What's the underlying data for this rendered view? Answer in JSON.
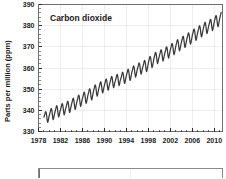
{
  "chart_data": {
    "type": "line",
    "title": "Carbon dioxide",
    "xlabel": "",
    "ylabel": "Parts per million (ppm)",
    "xlim": [
      1978,
      2011.5
    ],
    "ylim": [
      330,
      390
    ],
    "grid": true,
    "legend": null,
    "line_color": "#3a3a3a",
    "xticks": [
      1978,
      1982,
      1986,
      1990,
      1994,
      1998,
      2002,
      2006,
      2010
    ],
    "xtick_labels": [
      "1978",
      "1982",
      "1986",
      "1990",
      "1994",
      "1998",
      "2002",
      "2006",
      "2010"
    ],
    "xminor_tick_interval": 1,
    "yticks": [
      330,
      340,
      350,
      360,
      370,
      380,
      390
    ],
    "ytick_labels": [
      "330",
      "340",
      "350",
      "360",
      "370",
      "380",
      "390"
    ],
    "series": [
      {
        "name": "Atmospheric CO2 concentration",
        "description": "Monthly mean CO2 with seasonal sawtooth on rising trend",
        "x": [
          1979.0,
          1979.08,
          1979.17,
          1979.25,
          1979.33,
          1979.42,
          1979.5,
          1979.58,
          1979.67,
          1979.75,
          1979.83,
          1979.92,
          1980.0,
          1980.08,
          1980.17,
          1980.25,
          1980.33,
          1980.42,
          1980.5,
          1980.58,
          1980.67,
          1980.75,
          1980.83,
          1980.92,
          1981.0,
          1981.08,
          1981.17,
          1981.25,
          1981.33,
          1981.42,
          1981.5,
          1981.58,
          1981.67,
          1981.75,
          1981.83,
          1981.92,
          1982.0,
          1982.08,
          1982.17,
          1982.25,
          1982.33,
          1982.42,
          1982.5,
          1982.58,
          1982.67,
          1982.75,
          1982.83,
          1982.92,
          1983.0,
          1983.08,
          1983.17,
          1983.25,
          1983.33,
          1983.42,
          1983.5,
          1983.58,
          1983.67,
          1983.75,
          1983.83,
          1983.92,
          1984.0,
          1984.08,
          1984.17,
          1984.25,
          1984.33,
          1984.42,
          1984.5,
          1984.58,
          1984.67,
          1984.75,
          1984.83,
          1984.92,
          1985.0,
          1985.08,
          1985.17,
          1985.25,
          1985.33,
          1985.42,
          1985.5,
          1985.58,
          1985.67,
          1985.75,
          1985.83,
          1985.92,
          1986.0,
          1986.08,
          1986.17,
          1986.25,
          1986.33,
          1986.42,
          1986.5,
          1986.58,
          1986.67,
          1986.75,
          1986.83,
          1986.92,
          1987.0,
          1987.08,
          1987.17,
          1987.25,
          1987.33,
          1987.42,
          1987.5,
          1987.58,
          1987.67,
          1987.75,
          1987.83,
          1987.92,
          1988.0,
          1988.08,
          1988.17,
          1988.25,
          1988.33,
          1988.42,
          1988.5,
          1988.58,
          1988.67,
          1988.75,
          1988.83,
          1988.92,
          1989.0,
          1989.08,
          1989.17,
          1989.25,
          1989.33,
          1989.42,
          1989.5,
          1989.58,
          1989.67,
          1989.75,
          1989.83,
          1989.92,
          1990.0,
          1990.08,
          1990.17,
          1990.25,
          1990.33,
          1990.42,
          1990.5,
          1990.58,
          1990.67,
          1990.75,
          1990.83,
          1990.92,
          1991.0,
          1991.08,
          1991.17,
          1991.25,
          1991.33,
          1991.42,
          1991.5,
          1991.58,
          1991.67,
          1991.75,
          1991.83,
          1991.92,
          1992.0,
          1992.08,
          1992.17,
          1992.25,
          1992.33,
          1992.42,
          1992.5,
          1992.58,
          1992.67,
          1992.75,
          1992.83,
          1992.92,
          1993.0,
          1993.08,
          1993.17,
          1993.25,
          1993.33,
          1993.42,
          1993.5,
          1993.58,
          1993.67,
          1993.75,
          1993.83,
          1993.92,
          1994.0,
          1994.08,
          1994.17,
          1994.25,
          1994.33,
          1994.42,
          1994.5,
          1994.58,
          1994.67,
          1994.75,
          1994.83,
          1994.92,
          1995.0,
          1995.08,
          1995.17,
          1995.25,
          1995.33,
          1995.42,
          1995.5,
          1995.58,
          1995.67,
          1995.75,
          1995.83,
          1995.92,
          1996.0,
          1996.08,
          1996.17,
          1996.25,
          1996.33,
          1996.42,
          1996.5,
          1996.58,
          1996.67,
          1996.75,
          1996.83,
          1996.92,
          1997.0,
          1997.08,
          1997.17,
          1997.25,
          1997.33,
          1997.42,
          1997.5,
          1997.58,
          1997.67,
          1997.75,
          1997.83,
          1997.92,
          1998.0,
          1998.08,
          1998.17,
          1998.25,
          1998.33,
          1998.42,
          1998.5,
          1998.58,
          1998.67,
          1998.75,
          1998.83,
          1998.92,
          1999.0,
          1999.08,
          1999.17,
          1999.25,
          1999.33,
          1999.42,
          1999.5,
          1999.58,
          1999.67,
          1999.75,
          1999.83,
          1999.92,
          2000.0,
          2000.08,
          2000.17,
          2000.25,
          2000.33,
          2000.42,
          2000.5,
          2000.58,
          2000.67,
          2000.75,
          2000.83,
          2000.92,
          2001.0,
          2001.08,
          2001.17,
          2001.25,
          2001.33,
          2001.42,
          2001.5,
          2001.58,
          2001.67,
          2001.75,
          2001.83,
          2001.92,
          2002.0,
          2002.08,
          2002.17,
          2002.25,
          2002.33,
          2002.42,
          2002.5,
          2002.58,
          2002.67,
          2002.75,
          2002.83,
          2002.92,
          2003.0,
          2003.08,
          2003.17,
          2003.25,
          2003.33,
          2003.42,
          2003.5,
          2003.58,
          2003.67,
          2003.75,
          2003.83,
          2003.92,
          2004.0,
          2004.08,
          2004.17,
          2004.25,
          2004.33,
          2004.42,
          2004.5,
          2004.58,
          2004.67,
          2004.75,
          2004.83,
          2004.92,
          2005.0,
          2005.08,
          2005.17,
          2005.25,
          2005.33,
          2005.42,
          2005.5,
          2005.58,
          2005.67,
          2005.75,
          2005.83,
          2005.92,
          2006.0,
          2006.08,
          2006.17,
          2006.25,
          2006.33,
          2006.42,
          2006.5,
          2006.58,
          2006.67,
          2006.75,
          2006.83,
          2006.92,
          2007.0,
          2007.08,
          2007.17,
          2007.25,
          2007.33,
          2007.42,
          2007.5,
          2007.58,
          2007.67,
          2007.75,
          2007.83,
          2007.92,
          2008.0,
          2008.08,
          2008.17,
          2008.25,
          2008.33,
          2008.42,
          2008.5,
          2008.58,
          2008.67,
          2008.75,
          2008.83,
          2008.92,
          2009.0,
          2009.08,
          2009.17,
          2009.25,
          2009.33,
          2009.42,
          2009.5,
          2009.58,
          2009.67,
          2009.75,
          2009.83,
          2009.92,
          2010.0,
          2010.08,
          2010.17,
          2010.25,
          2010.33,
          2010.42,
          2010.5,
          2010.58,
          2010.67,
          2010.75,
          2010.83,
          2010.92,
          2011.0,
          2011.08,
          2011.17,
          2011.25
        ],
        "y": [
          336.8,
          337.6,
          338.3,
          339.2,
          339.4,
          338.7,
          337.2,
          335.3,
          334.3,
          334.8,
          336.0,
          337.2,
          338.0,
          338.7,
          339.6,
          340.6,
          340.9,
          340.2,
          338.6,
          336.7,
          335.6,
          336.1,
          337.3,
          338.4,
          339.2,
          340.0,
          340.9,
          341.9,
          342.2,
          341.5,
          339.9,
          338.0,
          336.9,
          337.4,
          338.6,
          339.7,
          340.2,
          341.0,
          341.9,
          342.9,
          343.2,
          342.5,
          340.9,
          339.0,
          337.9,
          338.4,
          339.6,
          340.7,
          341.3,
          342.1,
          343.0,
          344.0,
          344.3,
          343.6,
          342.0,
          340.1,
          339.0,
          339.5,
          340.7,
          341.8,
          342.7,
          343.5,
          344.4,
          345.4,
          345.7,
          345.0,
          343.4,
          341.5,
          340.4,
          340.9,
          342.1,
          343.2,
          344.2,
          345.0,
          345.9,
          346.9,
          347.2,
          346.5,
          344.9,
          343.0,
          341.9,
          342.4,
          343.6,
          344.7,
          345.6,
          346.4,
          347.3,
          348.3,
          348.6,
          347.9,
          346.3,
          344.4,
          343.3,
          343.8,
          345.0,
          346.1,
          347.2,
          348.0,
          348.9,
          349.9,
          350.2,
          349.5,
          347.9,
          346.0,
          344.9,
          345.4,
          346.6,
          347.7,
          349.0,
          349.8,
          350.7,
          351.7,
          352.0,
          351.3,
          349.7,
          347.8,
          346.7,
          347.2,
          348.4,
          349.5,
          350.5,
          351.3,
          352.2,
          353.2,
          353.5,
          352.8,
          351.2,
          349.3,
          348.2,
          348.7,
          349.9,
          351.0,
          351.8,
          352.6,
          353.5,
          354.5,
          354.8,
          354.1,
          352.5,
          350.6,
          349.5,
          350.0,
          351.2,
          352.3,
          353.0,
          353.8,
          354.7,
          355.7,
          356.0,
          355.3,
          353.7,
          351.8,
          350.7,
          351.2,
          352.4,
          353.5,
          354.0,
          354.8,
          355.7,
          356.7,
          357.0,
          356.3,
          354.7,
          352.8,
          351.7,
          352.2,
          353.4,
          354.5,
          355.0,
          355.8,
          356.7,
          357.7,
          358.0,
          357.3,
          355.7,
          353.8,
          352.7,
          353.2,
          354.4,
          355.5,
          356.4,
          357.2,
          358.1,
          359.1,
          359.4,
          358.7,
          357.1,
          355.2,
          354.1,
          354.6,
          355.8,
          356.9,
          358.0,
          358.8,
          359.7,
          360.7,
          361.0,
          360.3,
          358.7,
          356.8,
          355.7,
          356.2,
          357.4,
          358.5,
          359.4,
          360.2,
          361.1,
          362.1,
          362.4,
          361.7,
          360.1,
          358.2,
          357.1,
          357.6,
          358.8,
          359.9,
          360.6,
          361.4,
          362.3,
          363.3,
          363.6,
          362.9,
          361.3,
          359.4,
          358.3,
          358.8,
          360.0,
          361.1,
          362.5,
          363.3,
          364.2,
          365.2,
          365.5,
          364.8,
          363.2,
          361.3,
          360.2,
          360.7,
          361.9,
          363.0,
          364.4,
          365.2,
          366.1,
          367.1,
          367.4,
          366.7,
          365.1,
          363.2,
          362.1,
          362.6,
          363.8,
          364.9,
          365.6,
          366.4,
          367.3,
          368.3,
          368.6,
          367.9,
          366.3,
          364.4,
          363.3,
          363.8,
          365.0,
          366.1,
          367.0,
          367.8,
          368.7,
          369.7,
          370.0,
          369.3,
          367.7,
          365.8,
          364.7,
          365.2,
          366.4,
          367.5,
          368.6,
          369.4,
          370.3,
          371.3,
          371.6,
          370.9,
          369.3,
          367.4,
          366.3,
          366.8,
          368.0,
          369.1,
          370.4,
          371.2,
          372.1,
          373.1,
          373.4,
          372.7,
          371.1,
          369.2,
          368.1,
          368.6,
          369.8,
          370.9,
          372.0,
          372.8,
          373.7,
          374.7,
          375.0,
          374.3,
          372.7,
          370.8,
          369.7,
          370.2,
          371.4,
          372.5,
          373.6,
          374.4,
          375.3,
          376.3,
          376.6,
          375.9,
          374.3,
          372.4,
          371.3,
          371.8,
          373.0,
          374.1,
          375.4,
          376.2,
          377.1,
          378.1,
          378.4,
          377.7,
          376.1,
          374.2,
          373.1,
          373.6,
          374.8,
          375.9,
          377.0,
          377.8,
          378.7,
          379.7,
          380.0,
          379.3,
          377.7,
          375.8,
          374.7,
          375.2,
          376.4,
          377.5,
          378.6,
          379.4,
          380.3,
          381.3,
          381.6,
          380.9,
          379.3,
          377.4,
          376.3,
          376.8,
          378.0,
          379.1,
          380.0,
          380.8,
          381.7,
          382.7,
          383.0,
          382.3,
          380.7,
          378.8,
          377.7,
          378.2,
          379.4,
          380.5,
          381.8,
          382.6,
          383.5,
          384.5,
          384.8,
          384.1,
          382.5,
          380.6,
          379.5,
          380.0,
          381.2,
          382.3,
          383.6,
          384.4,
          385.3,
          386.3
        ],
        "start_value": 336.8,
        "end_value": 386.3,
        "peak_value": 390.0,
        "units": "ppm"
      }
    ]
  },
  "figure": {
    "secondary_panel_visible": true,
    "secondary_panel_note": ""
  }
}
